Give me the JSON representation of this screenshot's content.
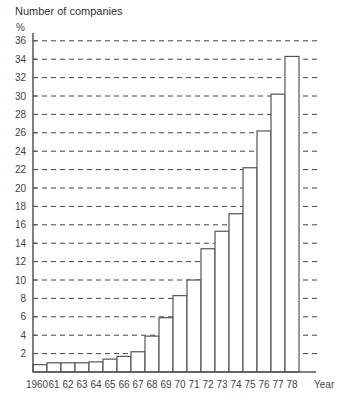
{
  "chart_data": {
    "type": "bar",
    "title": "Number of companies",
    "ylabel": "%",
    "xlabel": "Year",
    "ylim": [
      0,
      36
    ],
    "yticks": [
      2,
      4,
      6,
      8,
      10,
      12,
      14,
      16,
      18,
      20,
      22,
      24,
      26,
      28,
      30,
      32,
      34,
      36
    ],
    "grid": "dashed horizontal",
    "legend": null,
    "categories": [
      "1960",
      "61",
      "62",
      "63",
      "64",
      "65",
      "66",
      "67",
      "68",
      "69",
      "70",
      "71",
      "72",
      "73",
      "74",
      "75",
      "76",
      "77",
      "78"
    ],
    "values": [
      0.8,
      1.0,
      1.0,
      1.0,
      1.1,
      1.4,
      1.7,
      2.2,
      3.9,
      5.9,
      8.3,
      10.0,
      13.4,
      15.3,
      17.2,
      22.2,
      26.2,
      30.2,
      34.3
    ]
  },
  "colors": {
    "bar_fill": "#ffffff",
    "bar_stroke": "#555555",
    "axis": "#555555",
    "grid": "#444444"
  }
}
